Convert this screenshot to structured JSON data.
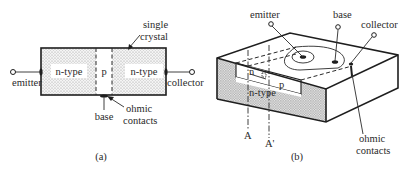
{
  "figure_a": {
    "caption": "(a)",
    "regions": [
      {
        "label": "n-type"
      },
      {
        "label": "p"
      },
      {
        "label": "n-type"
      }
    ],
    "terminals": {
      "emitter": "emitter",
      "collector": "collector",
      "base": "base"
    },
    "annotations": {
      "crystal_line1": "single",
      "crystal_line2": "crystal",
      "ohmic_line1": "ohmic",
      "ohmic_line2": "contacts"
    }
  },
  "figure_b": {
    "caption": "(b)",
    "regions": {
      "emitter_region": "n",
      "base_region": "p",
      "collector_region": "n-type"
    },
    "terminals": {
      "emitter": "emitter",
      "base": "base",
      "collector": "collector"
    },
    "annotations": {
      "ohmic_line1": "ohmic",
      "ohmic_line2": "contacts"
    },
    "section_lines": [
      "A",
      "A'"
    ]
  },
  "colors": {
    "stroke": "#1e1e1e",
    "stipple": "#bdbdbd",
    "background": "#ffffff"
  }
}
